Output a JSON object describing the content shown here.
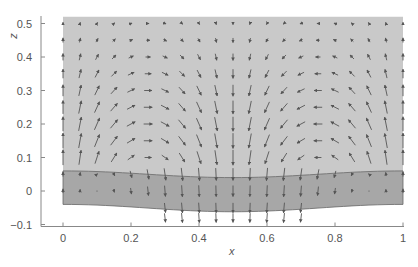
{
  "chart_data": {
    "type": "quiver",
    "title": "",
    "xlabel": "x",
    "ylabel": "z",
    "xlim": [
      0,
      1
    ],
    "ylim": [
      -0.1,
      0.52
    ],
    "xticks": [
      0,
      0.2,
      0.4,
      0.6,
      0.8,
      1
    ],
    "xtick_labels": [
      "0",
      "0.2",
      "0.4",
      "0.6",
      "0.8",
      "1"
    ],
    "yticks": [
      -0.1,
      0,
      0.1,
      0.2,
      0.3,
      0.4,
      0.5
    ],
    "ytick_labels": [
      "−0.1",
      "0",
      "0.1",
      "0.2",
      "0.3",
      "0.4",
      "0.5"
    ],
    "grid": false,
    "regions": [
      {
        "name": "upper-fluid",
        "color": "#c9c9c9",
        "top_z": 0.52,
        "bottom_profile": [
          [
            0,
            0.06
          ],
          [
            0.5,
            0.04
          ],
          [
            1,
            0.06
          ]
        ]
      },
      {
        "name": "lower-layer",
        "color": "#a7a7a7",
        "top_profile": [
          [
            0,
            0.06
          ],
          [
            0.5,
            0.04
          ],
          [
            1,
            0.06
          ]
        ],
        "bottom_profile": [
          [
            0,
            -0.04
          ],
          [
            0.5,
            -0.062
          ],
          [
            1,
            -0.04
          ]
        ]
      }
    ],
    "vector_field": {
      "x_spacing": 0.05,
      "z_spacing": 0.05,
      "x_range": [
        0,
        1
      ],
      "z_rows": [
        0.5,
        0.45,
        0.4,
        0.35,
        0.3,
        0.25,
        0.2,
        0.15,
        0.1,
        0.05,
        0.0,
        -0.05,
        -0.08
      ],
      "description": "Symmetric two-cell circulation: upward flow at x=0 and x=1, downward flow at x=0.5, horizontal flow toward center near x=0.25 and x=0.75; magnitudes grow toward the interface.",
      "u_amplitude_by_row": [
        0.05,
        0.09,
        0.13,
        0.17,
        0.2,
        0.22,
        0.23,
        0.22,
        0.18,
        0.08,
        0.04,
        0.05,
        0.05
      ],
      "w_amplitude_by_row": [
        0.06,
        0.12,
        0.18,
        0.24,
        0.3,
        0.35,
        0.38,
        0.4,
        0.4,
        0.4,
        0.36,
        0.32,
        0.3
      ],
      "lower_cell_x_limit": [
        0.28,
        0.72
      ],
      "arrow_color": "#555555"
    },
    "colors": {
      "axis": "#888888",
      "interface_line": "#666666"
    }
  }
}
